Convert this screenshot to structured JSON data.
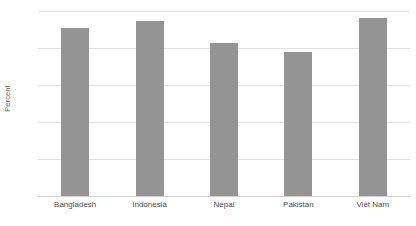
{
  "chart_data": {
    "type": "bar",
    "title": "",
    "xlabel": "",
    "ylabel": "Percent",
    "categories": [
      "Bangladesh",
      "Indonesia",
      "Nepal",
      "Pakistan",
      "Viet Nam"
    ],
    "values": [
      91,
      94.5,
      82.5,
      78,
      96
    ],
    "ylim": [
      0,
      100
    ],
    "yticks": [
      "0",
      "20",
      "40",
      "60",
      "80",
      "100"
    ],
    "ytick_values": [
      0,
      20,
      40,
      60,
      80,
      100
    ],
    "grid": true,
    "legend": "none",
    "colors": {
      "bar": "#949494",
      "gridline": "#e3e3e3",
      "baseline": "#d2d2d2",
      "tick_text": "#7a7a7a",
      "category_text": "#4f4f4f",
      "axis_title_text": "#5f5f5f",
      "background": "#ffffff"
    }
  }
}
